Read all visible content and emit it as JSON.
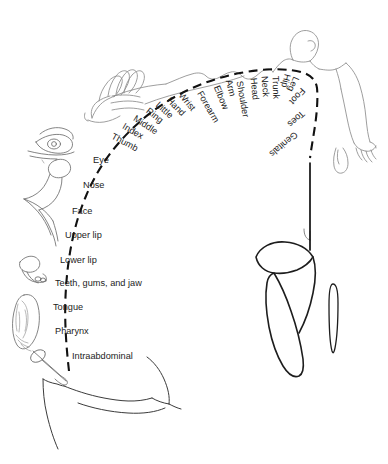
{
  "figure": {
    "background_color": "#ffffff",
    "line_color": "#1a1a1a",
    "body_outline_color": "#8d8d8d",
    "arc_style": "dashed"
  },
  "labels_rotated": [
    {
      "text": "Thumb",
      "x": 112,
      "y": 136,
      "angle": -62
    },
    {
      "text": "Index",
      "x": 123,
      "y": 126,
      "angle": -60
    },
    {
      "text": "Middle",
      "x": 134,
      "y": 118,
      "angle": -57
    },
    {
      "text": "Ring",
      "x": 147,
      "y": 110,
      "angle": -52
    },
    {
      "text": "Little",
      "x": 157,
      "y": 104,
      "angle": -48
    },
    {
      "text": "Hand",
      "x": 168,
      "y": 99,
      "angle": -44
    },
    {
      "text": "Wrist",
      "x": 180,
      "y": 94,
      "angle": -40
    },
    {
      "text": "Forearm",
      "x": 199,
      "y": 92,
      "angle": -30
    },
    {
      "text": "Elbow",
      "x": 216,
      "y": 86,
      "angle": -22
    },
    {
      "text": "Arm",
      "x": 228,
      "y": 80,
      "angle": -15
    },
    {
      "text": "Shoulder",
      "x": 239,
      "y": 81,
      "angle": -10
    },
    {
      "text": "Head",
      "x": 253,
      "y": 78,
      "angle": -6
    },
    {
      "text": "Neck",
      "x": 264,
      "y": 76,
      "angle": -4
    },
    {
      "text": "Trunk",
      "x": 275,
      "y": 76,
      "angle": -2
    },
    {
      "text": "Hip",
      "x": 287,
      "y": 74,
      "angle": 14
    },
    {
      "text": "Leg",
      "x": 296,
      "y": 77,
      "angle": 24
    },
    {
      "text": "Foot",
      "x": 303,
      "y": 89,
      "angle": 42
    },
    {
      "text": "Toes",
      "x": 303,
      "y": 112,
      "angle": 48
    },
    {
      "text": "Genitals",
      "x": 296,
      "y": 133,
      "angle": 50
    }
  ],
  "labels_horizontal": [
    {
      "text": "Eye",
      "x": 93,
      "y": 161
    },
    {
      "text": "Nose",
      "x": 83,
      "y": 186
    },
    {
      "text": "Face",
      "x": 72,
      "y": 212
    },
    {
      "text": "Upper lip",
      "x": 65,
      "y": 236
    },
    {
      "text": "Lower lip",
      "x": 60,
      "y": 261
    },
    {
      "text": "Teeth, gums, and jaw",
      "x": 55,
      "y": 284
    },
    {
      "text": "Tongue",
      "x": 53,
      "y": 308
    },
    {
      "text": "Pharynx",
      "x": 55,
      "y": 332
    },
    {
      "text": "Intraabdominal",
      "x": 72,
      "y": 357
    }
  ],
  "anatomy_parts": [
    {
      "name": "giant-hand",
      "region": "upper-left"
    },
    {
      "name": "homunculus-head",
      "region": "top-center"
    },
    {
      "name": "homunculus-torso",
      "region": "top-center"
    },
    {
      "name": "homunculus-arm",
      "region": "top-right"
    },
    {
      "name": "eye-drawing",
      "region": "left"
    },
    {
      "name": "nose-face-drawing",
      "region": "left"
    },
    {
      "name": "teeth-jaw-drawing",
      "region": "left-lower"
    },
    {
      "name": "tongue-drawing",
      "region": "left-lower"
    },
    {
      "name": "pharynx-drawing",
      "region": "left-lower"
    },
    {
      "name": "foot-toes-drawing",
      "region": "right-lower"
    },
    {
      "name": "genitals-drawing",
      "region": "right-lower"
    },
    {
      "name": "cortex-outline",
      "region": "bottom-center"
    }
  ]
}
